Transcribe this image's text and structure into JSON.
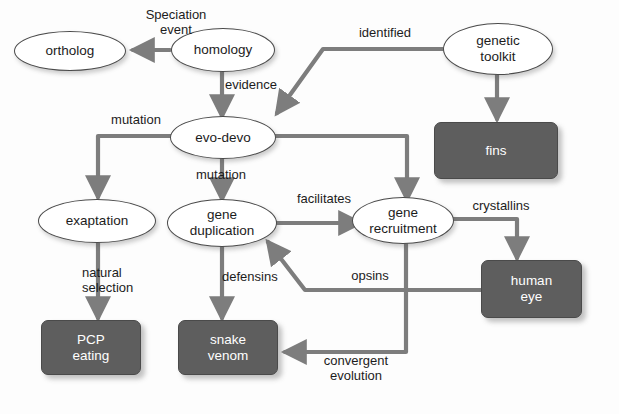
{
  "diagram": {
    "background_color": "#fdfdfd",
    "node_fill_ellipse": "#ffffff",
    "node_fill_box": "#5e5e5e",
    "edge_color": "#7d7d7d",
    "text_color": "#1c1c1c",
    "box_text_color": "#ffffff",
    "nodes": [
      {
        "id": "ortholog",
        "label": "ortholog",
        "shape": "ellipse"
      },
      {
        "id": "homology",
        "label": "homology",
        "shape": "ellipse"
      },
      {
        "id": "genetic-toolkit",
        "label": "genetic\ntoolkit",
        "shape": "ellipse"
      },
      {
        "id": "evo-devo",
        "label": "evo-devo",
        "shape": "ellipse"
      },
      {
        "id": "exaptation",
        "label": "exaptation",
        "shape": "ellipse"
      },
      {
        "id": "gene-duplication",
        "label": "gene\nduplication",
        "shape": "ellipse"
      },
      {
        "id": "gene-recruitment",
        "label": "gene\nrecruitment",
        "shape": "ellipse"
      },
      {
        "id": "fins",
        "label": "fins",
        "shape": "box"
      },
      {
        "id": "pcp-eating",
        "label": "PCP\neating",
        "shape": "box"
      },
      {
        "id": "snake-venom",
        "label": "snake\nvenom",
        "shape": "box"
      },
      {
        "id": "human-eye",
        "label": "human\neye",
        "shape": "box"
      }
    ],
    "edges": [
      {
        "id": "homology-ortholog",
        "from": "homology",
        "to": "ortholog",
        "label": "Speciation\nevent"
      },
      {
        "id": "homology-evodevo",
        "from": "homology",
        "to": "evo-devo",
        "label": "evidence"
      },
      {
        "id": "genetictoolkit-evodevo",
        "from": "genetic-toolkit",
        "to": "evo-devo",
        "label": "identified"
      },
      {
        "id": "genetictoolkit-fins",
        "from": "genetic-toolkit",
        "to": "fins",
        "label": ""
      },
      {
        "id": "evodevo-exaptation",
        "from": "evo-devo",
        "to": "exaptation",
        "label": "mutation"
      },
      {
        "id": "evodevo-geneduplication",
        "from": "evo-devo",
        "to": "gene-duplication",
        "label": "mutation"
      },
      {
        "id": "evodevo-generecruitment",
        "from": "evo-devo",
        "to": "gene-recruitment",
        "label": ""
      },
      {
        "id": "exaptation-pcpeating",
        "from": "exaptation",
        "to": "pcp-eating",
        "label": "natural\nselection"
      },
      {
        "id": "geneduplication-generecruitment",
        "from": "gene-duplication",
        "to": "gene-recruitment",
        "label": "facilitates"
      },
      {
        "id": "geneduplication-snakevenom",
        "from": "gene-duplication",
        "to": "snake-venom",
        "label": "defensins"
      },
      {
        "id": "generecruitment-humaneye",
        "from": "gene-recruitment",
        "to": "human-eye",
        "label": "crystallins"
      },
      {
        "id": "humaneye-geneduplication",
        "from": "human-eye",
        "to": "gene-duplication",
        "label": "opsins"
      },
      {
        "id": "generecruitment-snakevenom",
        "from": "gene-recruitment",
        "to": "snake-venom",
        "label": "convergent\nevolution"
      }
    ],
    "edge_labels": [
      {
        "id": "speciation-event",
        "text": "Speciation\nevent",
        "x": 126,
        "y": 8,
        "w": 100
      },
      {
        "id": "evidence",
        "text": "evidence",
        "x": 225,
        "y": 78,
        "w": 80
      },
      {
        "id": "identified",
        "text": "identified",
        "x": 345,
        "y": 26,
        "w": 80
      },
      {
        "id": "mutation-left",
        "text": "mutation",
        "x": 96,
        "y": 113,
        "w": 80
      },
      {
        "id": "mutation-center",
        "text": "mutation",
        "x": 196,
        "y": 168,
        "w": 80
      },
      {
        "id": "natural-selection",
        "text": "natural\nselection",
        "x": 82,
        "y": 266,
        "w": 80
      },
      {
        "id": "facilitates",
        "text": "facilitates",
        "x": 284,
        "y": 192,
        "w": 80
      },
      {
        "id": "defensins",
        "text": "defensins",
        "x": 222,
        "y": 270,
        "w": 80
      },
      {
        "id": "crystallins",
        "text": "crystallins",
        "x": 459,
        "y": 199,
        "w": 84
      },
      {
        "id": "opsins",
        "text": "opsins",
        "x": 338,
        "y": 269,
        "w": 64
      },
      {
        "id": "convergent-evolution",
        "text": "convergent\nevolution",
        "x": 306,
        "y": 354,
        "w": 100
      }
    ]
  }
}
